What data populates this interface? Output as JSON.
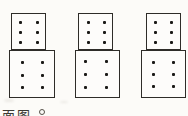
{
  "canvas": {
    "width": 188,
    "height": 116,
    "background": "#fcfbf8",
    "paper": "#fdfcfa",
    "line_color": "#2e2c28",
    "dot_color": "#1b1a17"
  },
  "figures": [
    {
      "id": "stacked-boxes-1",
      "top_box": {
        "x": 11,
        "y": 13,
        "w": 35,
        "h": 37,
        "dot_cols": [
          9,
          26
        ],
        "dot_rows": [
          9,
          19,
          29
        ],
        "dot_size": 3,
        "pip_count": 6
      },
      "bottom_box": {
        "x": 9,
        "y": 50,
        "w": 46,
        "h": 48,
        "dot_cols": [
          13,
          33
        ],
        "dot_rows": [
          12,
          25,
          37
        ],
        "dot_size": 3,
        "pip_count": 6
      }
    },
    {
      "id": "stacked-boxes-2",
      "top_box": {
        "x": 78,
        "y": 13,
        "w": 35,
        "h": 37,
        "dot_cols": [
          10,
          26
        ],
        "dot_rows": [
          9,
          19,
          29
        ],
        "dot_size": 3,
        "pip_count": 6
      },
      "bottom_box": {
        "x": 75,
        "y": 50,
        "w": 45,
        "h": 48,
        "dot_cols": [
          10,
          31
        ],
        "dot_rows": [
          11,
          24,
          37
        ],
        "dot_size": 3,
        "pip_count": 6
      }
    },
    {
      "id": "stacked-boxes-3",
      "top_box": {
        "x": 146,
        "y": 13,
        "w": 35,
        "h": 37,
        "dot_cols": [
          9,
          25
        ],
        "dot_rows": [
          9,
          19,
          29
        ],
        "dot_size": 3,
        "pip_count": 6
      },
      "bottom_box": {
        "x": 141,
        "y": 50,
        "w": 45,
        "h": 48,
        "dot_cols": [
          12,
          32
        ],
        "dot_rows": [
          12,
          24,
          36
        ],
        "dot_size": 3,
        "pip_count": 6
      }
    }
  ],
  "caption": {
    "visible_text": "面图",
    "punctuation": "。"
  }
}
